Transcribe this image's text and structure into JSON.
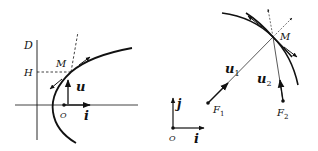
{
  "figure_left": {
    "title": "Parabola with directrix D and focus O",
    "labels": {
      "directrix": "D",
      "projection": "H",
      "point": "M",
      "vector_u": "u",
      "origin": "O",
      "vector_i": "i"
    }
  },
  "figure_right": {
    "title": "Conic with two foci F1 and F2",
    "labels": {
      "point": "M",
      "vector_u1": "u",
      "vector_u1_sub": "1",
      "vector_u2": "u",
      "vector_u2_sub": "2",
      "focus1": "F",
      "focus1_sub": "1",
      "focus2": "F",
      "focus2_sub": "2",
      "vector_j": "j",
      "origin": "O",
      "vector_i": "i"
    }
  },
  "colors": {
    "ink": "#111111",
    "background": "#ffffff"
  }
}
